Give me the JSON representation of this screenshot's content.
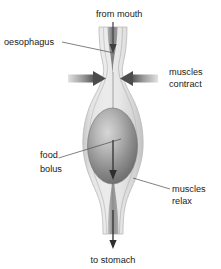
{
  "diagram": {
    "type": "biology-diagram",
    "width": 221,
    "height": 269,
    "background": "#ffffff"
  },
  "labels": {
    "from_mouth": "from mouth",
    "oesophagus": "oesophagus",
    "muscles_contract_line1": "muscles",
    "muscles_contract_line2": "contract",
    "food_bolus_line1": "food",
    "food_bolus_line2": "bolus",
    "muscles_relax_line1": "muscles",
    "muscles_relax_line2": "relax",
    "to_stomach": "to stomach"
  },
  "colors": {
    "wall_light": "#e3e3e3",
    "wall_mid": "#d2d2d2",
    "wall_edge": "#bdbdbd",
    "lumen_dark": "#8a8a8a",
    "bolus_light": "#cfcfcf",
    "bolus_dark": "#6e6e6e",
    "arrow_dark": "#4c4c4c",
    "arrow_shaft_light": "#d8d8d8",
    "text": "#1a1a1a",
    "leader": "#4a4a4a",
    "flow_arrow": "#555555"
  },
  "elements": {
    "oesophagus_tube": "tapering muscular tube, constricted above bolus, bulging at bolus",
    "food_bolus": "shaded ellipse with highlight",
    "contract_arrow_left": "right-pointing arrow into constricted region",
    "contract_arrow_right": "left-pointing arrow into constricted region",
    "flow_arrow_top": "downward arrow entering from mouth",
    "flow_arrow_middle": "downward arrow through bolus",
    "flow_arrow_bottom": "downward arrow exiting to stomach"
  }
}
